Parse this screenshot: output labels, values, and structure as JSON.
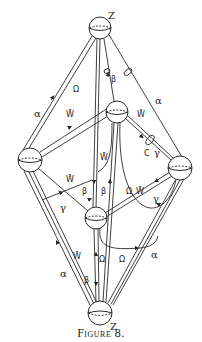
{
  "figure": {
    "caption": "Figure 8.",
    "stroke_color": "#2a2a2a",
    "nodes": [
      {
        "id": "z-top",
        "label": "Z",
        "cx": 100,
        "cy": 28,
        "r": 11
      },
      {
        "id": "upper-mid",
        "label": "",
        "cx": 117,
        "cy": 112,
        "r": 11
      },
      {
        "id": "left",
        "label": "",
        "cx": 30,
        "cy": 160,
        "r": 12
      },
      {
        "id": "right",
        "label": "",
        "cx": 180,
        "cy": 168,
        "r": 12
      },
      {
        "id": "lower-mid",
        "label": "",
        "cx": 96,
        "cy": 218,
        "r": 11
      },
      {
        "id": "z-bottom",
        "label": "Z",
        "cx": 100,
        "cy": 313,
        "r": 12
      }
    ],
    "labels": {
      "z_top": "Z",
      "z_bottom": "Z",
      "alpha_top_left": "α",
      "alpha_top_right": "α",
      "alpha_bottom_left": "α",
      "alpha_bottom_right": "α",
      "beta_top": "β",
      "beta_mid_left": "β",
      "beta_mid_right": "β",
      "beta_bottom": "β",
      "gamma_right_upper": "γ",
      "gamma_left": "γ",
      "gamma_right_lower": "γ",
      "c_label": "C",
      "omega_top": "Ω",
      "wbar_upper_left": "W̄",
      "wbar_upper_right": "W̄",
      "wbar_center": "W̄",
      "wbar_left_mid": "W̄",
      "omega_right_mid": "Ω",
      "wbar_right_mid": "W̄",
      "wbar_bottom_left": "W̄",
      "omega_bottom_center": "Ω",
      "omega_bottom_right": "Ω"
    }
  }
}
